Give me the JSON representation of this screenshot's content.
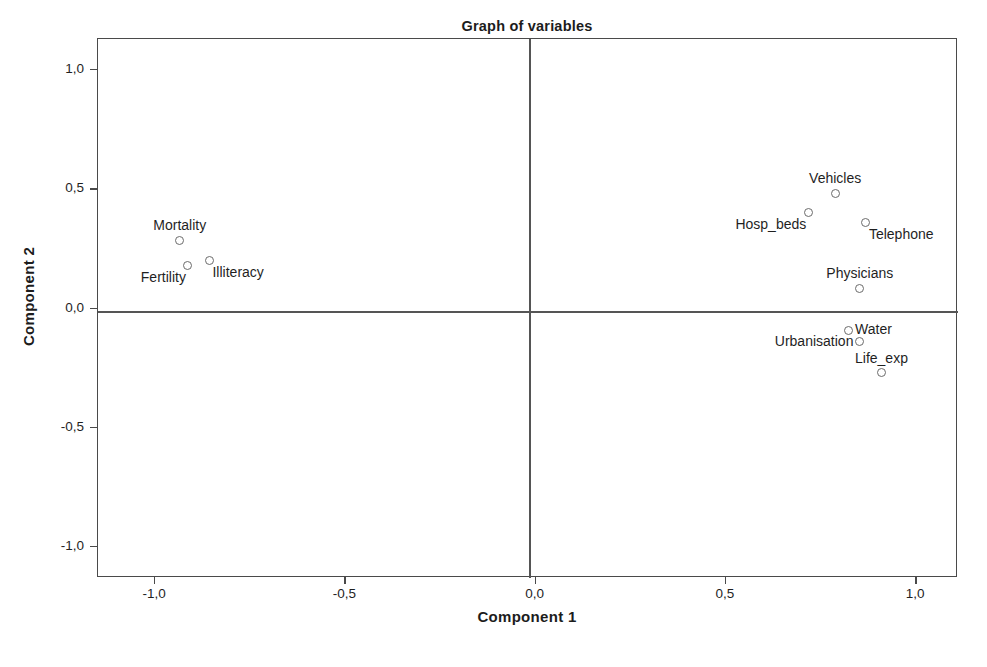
{
  "chart_data": {
    "type": "scatter",
    "title": "Graph of variables",
    "xlabel": "Component 1",
    "ylabel": "Component 2",
    "xlim": [
      -1.15,
      1.11
    ],
    "ylim": [
      -1.13,
      1.13
    ],
    "grid": false,
    "legend": null,
    "xticks": [
      -1.0,
      -0.5,
      0.0,
      0.5,
      1.0
    ],
    "yticks": [
      -1.0,
      -0.5,
      0.0,
      0.5,
      1.0
    ],
    "xticklabels": [
      "-1,0",
      "-0,5",
      "0,0",
      "0,5",
      "1,0"
    ],
    "yticklabels": [
      "-1,0",
      "-0,5",
      "0,0",
      "0,5",
      "1,0"
    ],
    "decimal_separator": ",",
    "marker_style": "open-circle",
    "marker_color": "#6b6b6b",
    "reference_lines": {
      "x": 0.0,
      "y": 0.0
    },
    "points": [
      {
        "label": "Mortality",
        "x": -0.935,
        "y": 0.286,
        "label_pos": "above"
      },
      {
        "label": "Fertility",
        "x": -0.914,
        "y": 0.181,
        "label_pos": "below-left"
      },
      {
        "label": "Illiteracy",
        "x": -0.857,
        "y": 0.202,
        "label_pos": "below-right"
      },
      {
        "label": "Hosp_beds",
        "x": 0.717,
        "y": 0.403,
        "label_pos": "below-left"
      },
      {
        "label": "Vehicles",
        "x": 0.787,
        "y": 0.483,
        "label_pos": "above"
      },
      {
        "label": "Telephone",
        "x": 0.868,
        "y": 0.361,
        "label_pos": "below-right"
      },
      {
        "label": "Physicians",
        "x": 0.852,
        "y": 0.084,
        "label_pos": "above"
      },
      {
        "label": "Water",
        "x": 0.821,
        "y": -0.092,
        "label_pos": "right"
      },
      {
        "label": "Urbanisation",
        "x": 0.852,
        "y": -0.139,
        "label_pos": "left"
      },
      {
        "label": "Life_exp",
        "x": 0.909,
        "y": -0.269,
        "label_pos": "above"
      }
    ]
  }
}
